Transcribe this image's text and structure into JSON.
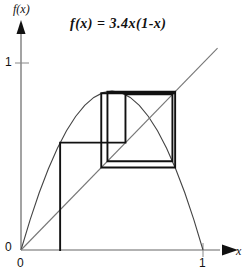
{
  "figure": {
    "title": "f(x)  =  3.4x(1-x)",
    "axis_label_y": "f(x)",
    "axis_label_x": "x",
    "tick_y_one": "1",
    "tick_y_zero": "0",
    "tick_x_zero": "0",
    "tick_x_one": "1",
    "colors": {
      "curve": "#444444",
      "diagonal": "#666666",
      "cobweb": "#111111",
      "axis": "#555555",
      "text": "#111111",
      "background": "#ffffff"
    }
  },
  "chart_data": {
    "type": "line",
    "title": "f(x)  =  3.4x(1-x)",
    "xlabel": "x",
    "ylabel": "f(x)",
    "xlim": [
      0,
      1.1
    ],
    "ylim": [
      0,
      1.15
    ],
    "grid": false,
    "legend_position": "none",
    "xticks": [
      0,
      1
    ],
    "xticklabels": [
      "0",
      "1"
    ],
    "yticks": [
      0,
      1
    ],
    "yticklabels": [
      "0",
      "1"
    ],
    "parameter_r": 3.4,
    "series": [
      {
        "name": "f(x) = 3.4x(1-x)",
        "type": "line",
        "x": [
          0.0,
          0.05,
          0.1,
          0.15,
          0.2,
          0.25,
          0.3,
          0.35,
          0.4,
          0.45,
          0.5,
          0.55,
          0.6,
          0.65,
          0.7,
          0.75,
          0.8,
          0.85,
          0.9,
          0.95,
          1.0
        ],
        "y": [
          0.0,
          0.1615,
          0.306,
          0.4335,
          0.544,
          0.6375,
          0.714,
          0.7735,
          0.816,
          0.8415,
          0.85,
          0.8415,
          0.816,
          0.7735,
          0.714,
          0.6375,
          0.544,
          0.4335,
          0.306,
          0.1615,
          0.0
        ]
      },
      {
        "name": "y = x",
        "type": "line",
        "x": [
          0.0,
          1.08
        ],
        "y": [
          0.0,
          1.08
        ]
      }
    ],
    "cobweb": {
      "description": "Cobweb iteration of the logistic map converging to a period-2 cycle",
      "fixed_point": 0.7059,
      "period_2_cycle": [
        0.452,
        0.8422
      ],
      "x0": 0.215,
      "path": [
        [
          0.215,
          0.0
        ],
        [
          0.215,
          0.574
        ],
        [
          0.574,
          0.574
        ],
        [
          0.574,
          0.832
        ],
        [
          0.832,
          0.832
        ],
        [
          0.832,
          0.475
        ],
        [
          0.475,
          0.475
        ],
        [
          0.475,
          0.847
        ],
        [
          0.847,
          0.847
        ],
        [
          0.847,
          0.441
        ],
        [
          0.441,
          0.441
        ],
        [
          0.441,
          0.838
        ],
        [
          0.838,
          0.838
        ]
      ]
    }
  }
}
